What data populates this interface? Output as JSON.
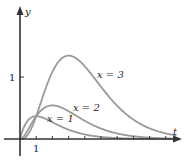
{
  "chart_data": {
    "type": "line",
    "title": "",
    "xlabel": "t",
    "ylabel": "y",
    "x_ticks": [
      1,
      2,
      3,
      4,
      5,
      6,
      7,
      8,
      9
    ],
    "x_tick_labels_shown": [
      "1"
    ],
    "y_ticks": [
      1
    ],
    "y_tick_labels_shown": [
      "1"
    ],
    "xlim": [
      0,
      10
    ],
    "ylim": [
      -0.3,
      2.1
    ],
    "grid": false,
    "legend": "inline curve labels",
    "formula_hint": "y = t^x e^{-t}",
    "series": [
      {
        "name": "x = 1",
        "label": "x = 1",
        "exponent": 1,
        "peak": {
          "t": 1,
          "y": 0.37
        }
      },
      {
        "name": "x = 2",
        "label": "x = 2",
        "exponent": 2,
        "peak": {
          "t": 2,
          "y": 0.54
        }
      },
      {
        "name": "x = 3",
        "label": "x = 3",
        "exponent": 3,
        "peak": {
          "t": 3,
          "y": 1.34
        }
      }
    ]
  },
  "labels": {
    "y_axis": "y",
    "t_axis": "t",
    "x_tick_1": "1",
    "y_tick_1": "1",
    "curve1": "x = 1",
    "curve2": "x = 2",
    "curve3": "x = 3"
  },
  "colors": {
    "axis": "#333333",
    "curve": "#9a9a9a"
  }
}
